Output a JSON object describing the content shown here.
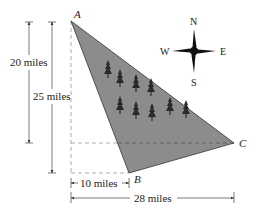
{
  "diagram": {
    "type": "land-triangle-with-dimensions",
    "vertices": {
      "A": {
        "label": "A",
        "x": 71,
        "y": 21
      },
      "B": {
        "label": "B",
        "x": 129,
        "y": 173
      },
      "C": {
        "label": "C",
        "x": 234,
        "y": 143
      }
    },
    "fill_color": "#8c8c8c",
    "dimensions": {
      "vertical_20": {
        "label": "20 miles",
        "value": 20,
        "unit": "miles"
      },
      "vertical_25": {
        "label": "25 miles",
        "value": 25,
        "unit": "miles"
      },
      "horizontal_10": {
        "label": "10 miles",
        "value": 10,
        "unit": "miles"
      },
      "horizontal_28": {
        "label": "28 miles",
        "value": 28,
        "unit": "miles"
      }
    },
    "compass": {
      "north": "N",
      "south": "S",
      "east": "E",
      "west": "W"
    },
    "trees": [
      {
        "x": 108,
        "y": 70
      },
      {
        "x": 120,
        "y": 79
      },
      {
        "x": 136,
        "y": 84
      },
      {
        "x": 151,
        "y": 88
      },
      {
        "x": 120,
        "y": 106
      },
      {
        "x": 136,
        "y": 111
      },
      {
        "x": 152,
        "y": 113
      },
      {
        "x": 170,
        "y": 107
      },
      {
        "x": 186,
        "y": 110
      }
    ]
  }
}
